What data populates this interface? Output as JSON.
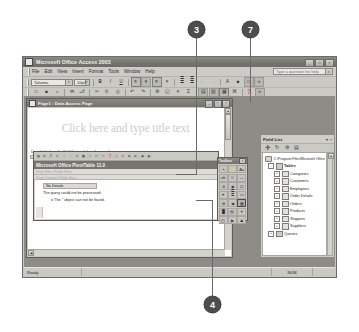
{
  "app": {
    "title": "Microsoft Office Access 2003",
    "window_buttons": [
      {
        "name": "minimize",
        "glyph": "_"
      },
      {
        "name": "restore",
        "glyph": "□"
      },
      {
        "name": "close",
        "glyph": "×"
      }
    ],
    "menu": [
      "File",
      "Edit",
      "View",
      "Insert",
      "Format",
      "Tools",
      "Window",
      "Help"
    ],
    "help_box": {
      "placeholder": "Type a question for help",
      "arrow": "▾"
    }
  },
  "formatting_toolbar": {
    "font": {
      "value": "Tahoma",
      "arrow": "▾"
    },
    "size": {
      "value": "10pt",
      "arrow": "▾"
    },
    "bold": "B",
    "italic": "I",
    "underline": "U",
    "align_left": "≡",
    "align_center": "≡",
    "align_right": "≡",
    "justify": "≡",
    "numbered_list": "≣",
    "bulleted_list": "≣",
    "outdent": "←",
    "indent": "→",
    "font_color": "A",
    "fill_color": "■",
    "border": "□",
    "more": "»"
  },
  "standard_toolbar": {
    "buttons": [
      "□",
      "■",
      "⌂",
      "✉",
      "⎇",
      "✂",
      "⎘",
      "⎙",
      "↶",
      "↷",
      "⚙",
      "◱",
      "≡",
      "Σ",
      "▤",
      "▥",
      "▦",
      "⌘",
      "❓",
      "»"
    ]
  },
  "document_window": {
    "title": "Page1 : Data Access Page",
    "buttons": [
      {
        "name": "minimize",
        "glyph": "_"
      },
      {
        "name": "restore",
        "glyph": "□"
      },
      {
        "name": "close",
        "glyph": "×"
      }
    ],
    "title_placeholder": "Click here and type title text",
    "drag_hint": "Drag fields from the Field List and drop them on the page."
  },
  "pivot_dialog": {
    "title": "Microsoft Office PivotTable 11.0",
    "drop_filter_text": "Drop Filter Fields Here",
    "drop_column_text": "Drop Column Fields Here",
    "no_details_label": "No Details",
    "error_line1": "The query could not be processed:",
    "error_line2": "o The '' object can not be found.",
    "toolbar_buttons": [
      "▤",
      "⚙",
      "Σ",
      "↻",
      "↑",
      "↓",
      "≡",
      "▦",
      "✂",
      "⎘",
      "□",
      "❓",
      "⋮",
      "▾",
      "⊞",
      "⊟",
      "◀",
      "▶"
    ]
  },
  "toolbox": {
    "title": "Toolbox",
    "close_glyph": "×",
    "tools": [
      {
        "name": "select-objects-tool",
        "glyph": "↖"
      },
      {
        "name": "control-wizards-tool",
        "glyph": "✨"
      },
      {
        "name": "label-tool",
        "glyph": "Aa"
      },
      {
        "name": "bound-span-tool",
        "glyph": "ab"
      },
      {
        "name": "text-box-tool",
        "glyph": "□"
      },
      {
        "name": "scrolling-text-tool",
        "glyph": "↔"
      },
      {
        "name": "option-group-tool",
        "glyph": "⊚"
      },
      {
        "name": "option-button-tool",
        "glyph": "◉"
      },
      {
        "name": "check-box-tool",
        "glyph": "☑"
      },
      {
        "name": "dropdown-list-tool",
        "glyph": "▾"
      },
      {
        "name": "list-box-tool",
        "glyph": "≣"
      },
      {
        "name": "command-button-tool",
        "glyph": "▭"
      },
      {
        "name": "expand-control-tool",
        "glyph": "⊞"
      },
      {
        "name": "record-navigation-tool",
        "glyph": "◀"
      },
      {
        "name": "office-pivottable-tool",
        "glyph": "▦"
      },
      {
        "name": "office-chart-tool",
        "glyph": "█"
      },
      {
        "name": "office-spreadsheet-tool",
        "glyph": "▤"
      },
      {
        "name": "hyperlink-tool",
        "glyph": "⚭"
      },
      {
        "name": "image-hyperlink-tool",
        "glyph": "◰"
      },
      {
        "name": "movie-tool",
        "glyph": "▶"
      },
      {
        "name": "image-tool",
        "glyph": "⛰"
      },
      {
        "name": "line-tool",
        "glyph": "\\"
      },
      {
        "name": "rectangle-tool",
        "glyph": "▭"
      },
      {
        "name": "more-controls-tool",
        "glyph": "⌘"
      }
    ],
    "selected_index": 14
  },
  "field_list": {
    "title": "Field List",
    "dropdown_glyph": "▾",
    "close_glyph": "×",
    "toolbar_buttons": [
      "➕",
      "↻",
      "⚙",
      "▤"
    ],
    "database_path": "C:\\Program Files\\Microsoft Office",
    "groups": [
      {
        "label": "Tables",
        "expander": "-",
        "items": [
          "Categories",
          "Customers",
          "Employees",
          "Order Details",
          "Orders",
          "Products",
          "Shippers",
          "Suppliers"
        ]
      },
      {
        "label": "Queries",
        "expander": "+",
        "items": []
      }
    ]
  },
  "status_bar": {
    "message": "Ready",
    "num_indicator": "NUM"
  },
  "callouts": [
    {
      "number": "3"
    },
    {
      "number": "7"
    },
    {
      "number": "4"
    }
  ]
}
